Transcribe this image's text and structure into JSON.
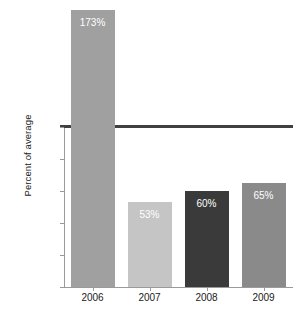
{
  "chart_data": {
    "type": "bar",
    "title": "",
    "xlabel": "",
    "ylabel": "Percent of average",
    "categories": [
      "2006",
      "2007",
      "2008",
      "2009"
    ],
    "values": [
      173,
      53,
      60,
      65
    ],
    "value_labels": [
      "173%",
      "53%",
      "60%",
      "65%"
    ],
    "bar_colors": [
      "#a0a0a0",
      "#c5c5c5",
      "#3a3a3a",
      "#8a8a8a"
    ],
    "value_label_color": "#ffffff",
    "ylim": [
      0,
      180
    ],
    "y_ticks": [
      0,
      20,
      40,
      60,
      80,
      100
    ],
    "y_tick_labels": [
      "0%",
      "20%",
      "40%",
      "60%",
      "80%",
      "100%"
    ],
    "grid": false,
    "legend": null,
    "reference_line": {
      "value": 100,
      "label": "100%",
      "color": "#404040"
    },
    "axis_color": "#9a9a9a",
    "background": "#ffffff"
  },
  "axes": {
    "y_title": "Percent of average"
  }
}
